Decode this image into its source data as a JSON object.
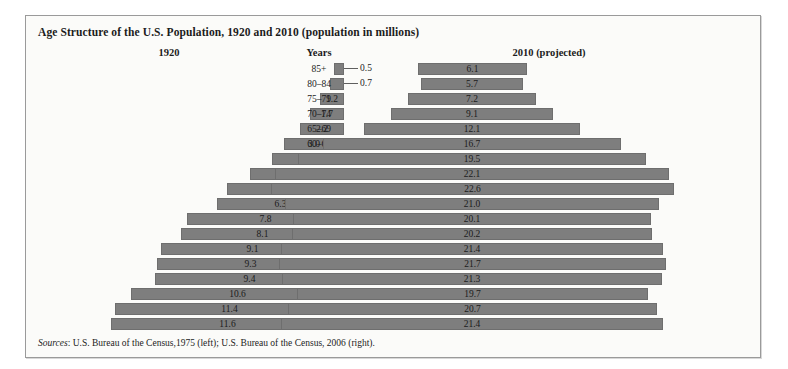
{
  "title": "Age Structure of the U.S. Population, 1920 and 2010 (population in millions)",
  "headers": {
    "left": "1920",
    "center": "Years",
    "right": "2010 (projected)"
  },
  "source": {
    "label": "Sources",
    "text": ": U.S. Bureau of the Census,1975 (left); U.S. Bureau of the Census, 2006 (right)."
  },
  "colors": {
    "bar_fill": "#7e7e7e",
    "bar_stroke": "#6e6e6e",
    "panel_bg": "#fbfbf9",
    "panel_border": "#9a9a9a",
    "text": "#1b1b1b"
  },
  "chart_data": {
    "type": "bar",
    "title": "Age Structure of the U.S. Population, 1920 and 2010 (population in millions)",
    "xlabel": "Population (millions)",
    "ylabel": "Years",
    "grid": false,
    "legend_position": "top",
    "orientation": "population-pyramid",
    "categories": [
      "85+",
      "80–84",
      "75–79",
      "70–74",
      "65–69",
      "60–64",
      "55–59",
      "50–54",
      "45–49",
      "40–44",
      "35–39",
      "30–34",
      "25–29",
      "20–24",
      "15–19",
      "10–14",
      "5–9",
      "0–4"
    ],
    "series": [
      {
        "name": "1920",
        "side": "left",
        "values": [
          0.5,
          0.7,
          1.2,
          1.7,
          2.2,
          3.0,
          3.6,
          4.7,
          5.8,
          6.3,
          7.8,
          8.1,
          9.1,
          9.3,
          9.4,
          10.6,
          11.4,
          11.6
        ],
        "labels": [
          "0.5",
          "0.7",
          "1.2",
          "1.7",
          "2.2",
          "3.0",
          "3.6",
          "4.7",
          "5.8",
          "6.3",
          "7.8",
          "8.1",
          "9.1",
          "9.3",
          "9.4",
          "10.6",
          "11.4",
          "11.6"
        ],
        "label_outside": [
          true,
          true,
          false,
          false,
          false,
          false,
          false,
          false,
          false,
          false,
          false,
          false,
          false,
          false,
          false,
          false,
          false,
          false
        ]
      },
      {
        "name": "2010 (projected)",
        "side": "right",
        "values": [
          6.1,
          5.7,
          7.2,
          9.1,
          12.1,
          16.7,
          19.5,
          22.1,
          22.6,
          21.0,
          20.1,
          20.2,
          21.4,
          21.7,
          21.3,
          19.7,
          20.7,
          21.4
        ],
        "labels": [
          "6.1",
          "5.7",
          "7.2",
          "9.1",
          "12.1",
          "16.7",
          "19.5",
          "22.1",
          "22.6",
          "21.0",
          "20.1",
          "20.2",
          "21.4",
          "21.7",
          "21.3",
          "19.7",
          "20.7",
          "21.4"
        ],
        "label_outside": [
          false,
          false,
          false,
          false,
          false,
          false,
          false,
          false,
          false,
          false,
          false,
          false,
          false,
          false,
          false,
          false,
          false,
          false
        ]
      }
    ],
    "xlim_left": [
      0,
      11.6
    ],
    "xlim_right": [
      0,
      22.6
    ]
  }
}
